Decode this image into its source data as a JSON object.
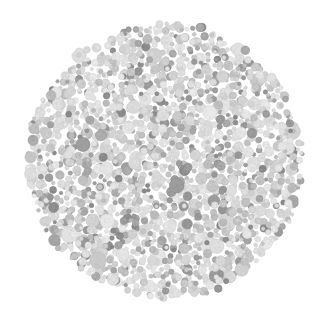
{
  "figure": {
    "kind": "ishihara-plate",
    "title": "Ishihara pseudoisochromatic test plate (grayscale)",
    "caption": "",
    "hidden_figure": "",
    "hidden_figure_visible": false,
    "background_color": "#ffffff",
    "width": 329,
    "height": 321
  },
  "chart_data": {
    "type": "scatter",
    "title": "Ishihara pseudoisochromatic test plate (grayscale)",
    "subtitle": "",
    "xlabel": "",
    "ylabel": "",
    "grid": false,
    "legend_position": "none",
    "xlim": [
      0,
      329
    ],
    "ylim": [
      0,
      321
    ],
    "plate": {
      "center_x": 165,
      "center_y": 161,
      "radius": 140,
      "edge_style": "ragged",
      "edge_jitter": 5,
      "background_color": "#ffffff"
    },
    "dots": {
      "count": 1850,
      "min_diameter": 3,
      "max_diameter": 18,
      "texture": "radial-stipple",
      "packing": "poisson-jitter"
    },
    "palette": [
      {
        "name": "light-gray-1",
        "color": "#e4e4e4",
        "weight": 22
      },
      {
        "name": "light-gray-2",
        "color": "#dcdcdc",
        "weight": 20
      },
      {
        "name": "light-gray-3",
        "color": "#d4d4d4",
        "weight": 16
      },
      {
        "name": "mid-gray-1",
        "color": "#c8c8c8",
        "weight": 13
      },
      {
        "name": "mid-gray-2",
        "color": "#bdbdbd",
        "weight": 9
      },
      {
        "name": "dark-gray-1",
        "color": "#a8a8a8",
        "weight": 8
      },
      {
        "name": "dark-gray-2",
        "color": "#9a9a9a",
        "weight": 7
      },
      {
        "name": "dark-gray-3",
        "color": "#8c8c8c",
        "weight": 5
      }
    ],
    "size_distribution": [
      {
        "diameter": 4,
        "weight": 20
      },
      {
        "diameter": 6,
        "weight": 24
      },
      {
        "diameter": 8,
        "weight": 22
      },
      {
        "diameter": 10,
        "weight": 16
      },
      {
        "diameter": 13,
        "weight": 11
      },
      {
        "diameter": 16,
        "weight": 5
      },
      {
        "diameter": 18,
        "weight": 2
      }
    ]
  }
}
